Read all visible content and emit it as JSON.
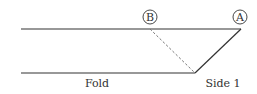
{
  "diagram": {
    "points": {
      "A": {
        "label": "A"
      },
      "B": {
        "label": "B"
      }
    },
    "labels": {
      "fold": "Fold",
      "side": "Side 1"
    },
    "colors": {
      "line": "#333333",
      "dashed": "#777777"
    }
  }
}
